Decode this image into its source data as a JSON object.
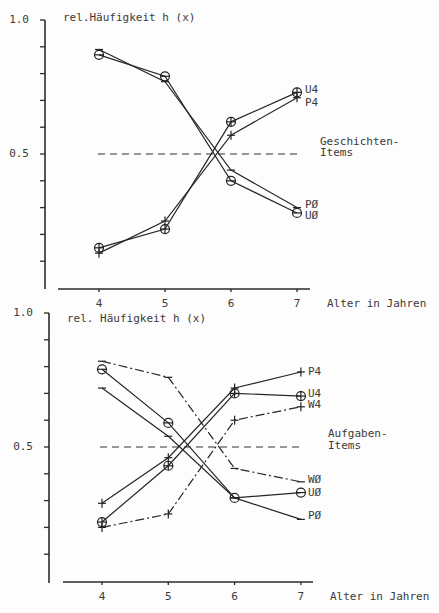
{
  "colors": {
    "ink": "#262626",
    "text": "#3a3a3a",
    "background": "#fdfdfd"
  },
  "chart_data": [
    {
      "type": "line",
      "title": "rel.Häufigkeit h (x)",
      "ylabel": "rel.Häufigkeit h (x)",
      "xlabel": "Alter in Jahren",
      "categories": [
        4,
        5,
        6,
        7
      ],
      "x_tick_labels": [
        "4",
        "5",
        "6",
        "7"
      ],
      "ylim": [
        0,
        1.0
      ],
      "y_ticks": [
        0.1,
        0.2,
        0.3,
        0.4,
        0.5,
        0.6,
        0.7,
        0.8,
        0.9,
        1.0
      ],
      "y_tick_labels": [
        {
          "value": 1.0,
          "label": "1.0"
        },
        {
          "value": 0.5,
          "label": "0.5"
        }
      ],
      "grid": false,
      "reference_line": {
        "y": 0.5,
        "style": "dashed"
      },
      "annotation": {
        "lines": [
          "Geschichten-",
          "Items"
        ],
        "y": [
          0.545,
          0.504
        ]
      },
      "series": [
        {
          "name": "U4",
          "values": [
            0.15,
            0.22,
            0.62,
            0.73
          ],
          "marker": "circle-plus",
          "line": "solid",
          "label_y": 0.739
        },
        {
          "name": "P4",
          "values": [
            0.13,
            0.25,
            0.57,
            0.71
          ],
          "marker": "plus",
          "line": "solid",
          "label_y": 0.694
        },
        {
          "name": "PØ",
          "values": [
            0.89,
            0.77,
            0.44,
            0.3
          ],
          "marker": "dash",
          "line": "solid",
          "label_y": 0.31
        },
        {
          "name": "UØ",
          "values": [
            0.87,
            0.79,
            0.4,
            0.28
          ],
          "marker": "circle-minus",
          "line": "solid",
          "label_y": 0.269
        }
      ]
    },
    {
      "type": "line",
      "title": "rel. Häufigkeit h (x)",
      "ylabel": "rel. Häufigkeit h (x)",
      "xlabel": "Alter in Jahren",
      "categories": [
        4,
        5,
        6,
        7
      ],
      "x_tick_labels": [
        "4",
        "5",
        "6",
        "7"
      ],
      "ylim": [
        0,
        1.0
      ],
      "y_ticks": [
        0.1,
        0.2,
        0.3,
        0.4,
        0.5,
        0.6,
        0.7,
        0.8,
        0.9,
        1.0
      ],
      "y_tick_labels": [
        {
          "value": 1.0,
          "label": "1.0"
        },
        {
          "value": 0.5,
          "label": "0.5"
        }
      ],
      "grid": false,
      "reference_line": {
        "y": 0.5,
        "style": "dashed"
      },
      "annotation": {
        "lines": [
          "Aufgaben-",
          "Items"
        ],
        "y": [
          0.552,
          0.504
        ]
      },
      "series": [
        {
          "name": "P4",
          "values": [
            0.29,
            0.46,
            0.72,
            0.78
          ],
          "marker": "plus",
          "line": "solid",
          "label_y": 0.78
        },
        {
          "name": "U4",
          "values": [
            0.22,
            0.43,
            0.7,
            0.69
          ],
          "marker": "circle-plus",
          "line": "solid",
          "label_y": 0.698
        },
        {
          "name": "W4",
          "values": [
            0.2,
            0.25,
            0.6,
            0.65
          ],
          "marker": "plus",
          "line": "dash-dot",
          "label_y": 0.657
        },
        {
          "name": "WØ",
          "values": [
            0.82,
            0.76,
            0.42,
            0.37
          ],
          "marker": "dash",
          "line": "dash-dot",
          "label_y": 0.38
        },
        {
          "name": "UØ",
          "values": [
            0.79,
            0.59,
            0.31,
            0.33
          ],
          "marker": "circle-minus",
          "line": "solid",
          "label_y": 0.332
        },
        {
          "name": "PØ",
          "values": [
            0.72,
            0.54,
            0.31,
            0.23
          ],
          "marker": "dash",
          "line": "solid",
          "label_y": 0.246
        }
      ]
    }
  ]
}
